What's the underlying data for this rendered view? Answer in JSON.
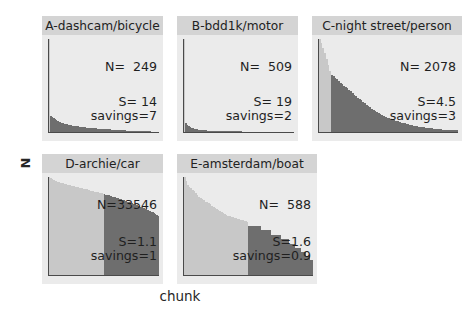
{
  "figure": {
    "xlabel": "chunk",
    "ylabel": "N",
    "background": "#ffffff",
    "title_band_color": "#d4d4d4",
    "axes_background": "#ebebeb",
    "bar_light_color": "#c8c8c8",
    "bar_dark_color": "#6e6e6e",
    "spine_color": "#4a4a4a"
  },
  "chart_data": {
    "type": "bar",
    "title": "",
    "xlabel": "chunk",
    "ylabel": "N",
    "grid": false,
    "legend": "none",
    "layout": "2 rows x 3 columns (5 panels, bottom-right empty)",
    "panels": [
      {
        "id": "A",
        "title": "A-dashcam/bicycle",
        "N_label": "N=  249",
        "N": 249,
        "S_label": "S= 14",
        "S": 14,
        "savings_label": "savings=7",
        "savings": 7,
        "split_index": 1,
        "values": [
          1.0,
          0.175,
          0.16,
          0.148,
          0.138,
          0.128,
          0.12,
          0.112,
          0.105,
          0.1,
          0.095,
          0.09,
          0.086,
          0.082,
          0.079,
          0.076,
          0.073,
          0.07,
          0.067,
          0.064,
          0.062,
          0.06,
          0.058,
          0.056,
          0.054,
          0.052,
          0.05,
          0.048,
          0.046,
          0.045,
          0.043,
          0.042,
          0.04,
          0.039,
          0.038,
          0.037,
          0.036,
          0.035,
          0.034,
          0.033,
          0.032,
          0.031,
          0.03,
          0.029,
          0.028,
          0.027,
          0.026,
          0.025,
          0.024,
          0.023,
          0.022,
          0.021,
          0.02,
          0.019,
          0.018,
          0.017,
          0.016,
          0.015,
          0.014,
          0.013,
          0.012,
          0.012,
          0.011,
          0.011,
          0.01,
          0.01,
          0.009,
          0.009,
          0.008,
          0.008,
          0.007,
          0.007,
          0.006,
          0.006,
          0.005,
          0.005,
          0.005,
          0.004,
          0.004,
          0.004
        ]
      },
      {
        "id": "B",
        "title": "B-bdd1k/motor",
        "N_label": "N=  509",
        "N": 509,
        "S_label": "S= 19",
        "S": 19,
        "savings_label": "savings=2",
        "savings": 2,
        "split_index": 1,
        "values": [
          1.0,
          0.1,
          0.075,
          0.062,
          0.052,
          0.045,
          0.04,
          0.036,
          0.032,
          0.029,
          0.026,
          0.024,
          0.022,
          0.02,
          0.019,
          0.018,
          0.017,
          0.016,
          0.015,
          0.014,
          0.013,
          0.013,
          0.012,
          0.012,
          0.011,
          0.011,
          0.01,
          0.01,
          0.009,
          0.009,
          0.009,
          0.008,
          0.008,
          0.008,
          0.007,
          0.007,
          0.007,
          0.007,
          0.006,
          0.006,
          0.006,
          0.006,
          0.005,
          0.005,
          0.005,
          0.005,
          0.005,
          0.004,
          0.004,
          0.004,
          0.004,
          0.004,
          0.004,
          0.004,
          0.003,
          0.003,
          0.003,
          0.003,
          0.003,
          0.003,
          0.003,
          0.003,
          0.003,
          0.003,
          0.003,
          0.003,
          0.003,
          0.003,
          0.003,
          0.003,
          0.003,
          0.003,
          0.003,
          0.003,
          0.003,
          0.003,
          0.003,
          0.003,
          0.003,
          0.003
        ]
      },
      {
        "id": "C",
        "title": "C-night street/person",
        "N_label": "N= 2078",
        "N": 2078,
        "S_label": "S=4.5",
        "S": 4.5,
        "savings_label": "savings=3",
        "savings": 3,
        "split_index": 7,
        "values": [
          1.0,
          0.96,
          0.9,
          0.85,
          0.79,
          0.72,
          0.66,
          0.615,
          0.6,
          0.585,
          0.565,
          0.55,
          0.53,
          0.515,
          0.5,
          0.485,
          0.47,
          0.455,
          0.44,
          0.42,
          0.4,
          0.385,
          0.37,
          0.355,
          0.34,
          0.325,
          0.31,
          0.295,
          0.28,
          0.265,
          0.25,
          0.235,
          0.222,
          0.21,
          0.2,
          0.19,
          0.18,
          0.172,
          0.163,
          0.155,
          0.147,
          0.14,
          0.133,
          0.126,
          0.12,
          0.114,
          0.108,
          0.102,
          0.097,
          0.092,
          0.087,
          0.083,
          0.078,
          0.074,
          0.07,
          0.066,
          0.063,
          0.059,
          0.056,
          0.053,
          0.05,
          0.047,
          0.045,
          0.042,
          0.04,
          0.038,
          0.036,
          0.034,
          0.032,
          0.03,
          0.028,
          0.027,
          0.025,
          0.024,
          0.022,
          0.021,
          0.02,
          0.019,
          0.018,
          0.017
        ]
      },
      {
        "id": "D",
        "title": "D-archie/car",
        "N_label": "N=33546",
        "N": 33546,
        "S_label": "S=1.1",
        "S": 1.1,
        "savings_label": "savings=1",
        "savings": 1,
        "split_index": 40,
        "values": [
          1.0,
          0.985,
          0.975,
          0.968,
          0.962,
          0.956,
          0.951,
          0.946,
          0.942,
          0.938,
          0.934,
          0.93,
          0.926,
          0.922,
          0.918,
          0.915,
          0.911,
          0.908,
          0.904,
          0.901,
          0.897,
          0.894,
          0.89,
          0.887,
          0.883,
          0.88,
          0.876,
          0.873,
          0.869,
          0.866,
          0.862,
          0.859,
          0.855,
          0.851,
          0.848,
          0.844,
          0.84,
          0.837,
          0.833,
          0.829,
          0.825,
          0.821,
          0.817,
          0.813,
          0.809,
          0.805,
          0.8,
          0.796,
          0.792,
          0.787,
          0.783,
          0.778,
          0.774,
          0.769,
          0.764,
          0.759,
          0.754,
          0.749,
          0.744,
          0.739,
          0.733,
          0.728,
          0.722,
          0.717,
          0.711,
          0.705,
          0.699,
          0.693,
          0.687,
          0.68,
          0.674,
          0.667,
          0.66,
          0.653,
          0.646,
          0.639,
          0.631,
          0.623,
          0.615,
          0.607
        ]
      },
      {
        "id": "E",
        "title": "E-amsterdam/boat",
        "N_label": "N=  588",
        "N": 588,
        "S_label": "S=1.6",
        "S": 1.6,
        "savings_label": "savings=0.9",
        "savings": 0.9,
        "split_index": 40,
        "values": [
          1.0,
          0.955,
          0.915,
          0.9,
          0.885,
          0.87,
          0.855,
          0.84,
          0.82,
          0.8,
          0.79,
          0.78,
          0.765,
          0.75,
          0.74,
          0.73,
          0.72,
          0.705,
          0.695,
          0.685,
          0.675,
          0.665,
          0.655,
          0.645,
          0.635,
          0.625,
          0.615,
          0.605,
          0.6,
          0.595,
          0.59,
          0.585,
          0.58,
          0.575,
          0.57,
          0.565,
          0.56,
          0.555,
          0.55,
          0.545,
          0.5,
          0.5,
          0.5,
          0.5,
          0.5,
          0.5,
          0.5,
          0.5,
          0.455,
          0.455,
          0.455,
          0.455,
          0.455,
          0.455,
          0.41,
          0.41,
          0.41,
          0.41,
          0.41,
          0.41,
          0.365,
          0.365,
          0.365,
          0.365,
          0.365,
          0.32,
          0.32,
          0.32,
          0.32,
          0.275,
          0.275,
          0.275,
          0.275,
          0.23,
          0.23,
          0.23,
          0.19,
          0.19,
          0.15,
          0.15
        ]
      }
    ]
  }
}
